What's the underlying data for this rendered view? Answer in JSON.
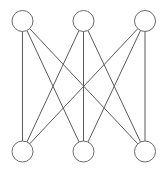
{
  "diagram": {
    "type": "bipartite-graph",
    "colors": {
      "background": "#ffffff",
      "edge": "#5a5a5a",
      "node_stroke": "#6a6a6a",
      "node_fill": "#ffffff"
    },
    "node_radius": 10.5,
    "nodes": [
      {
        "id": "t1",
        "row": "top",
        "x": 22.5,
        "y": 21
      },
      {
        "id": "t2",
        "row": "top",
        "x": 83.5,
        "y": 21
      },
      {
        "id": "t3",
        "row": "top",
        "x": 145,
        "y": 21
      },
      {
        "id": "b1",
        "row": "bottom",
        "x": 22.5,
        "y": 151.5
      },
      {
        "id": "b2",
        "row": "bottom",
        "x": 83.5,
        "y": 151.5
      },
      {
        "id": "b3",
        "row": "bottom",
        "x": 145,
        "y": 151.5
      }
    ],
    "edges": [
      [
        "t1",
        "b1"
      ],
      [
        "t1",
        "b2"
      ],
      [
        "t1",
        "b3"
      ],
      [
        "t2",
        "b1"
      ],
      [
        "t2",
        "b2"
      ],
      [
        "t2",
        "b3"
      ],
      [
        "t3",
        "b1"
      ],
      [
        "t3",
        "b2"
      ],
      [
        "t3",
        "b3"
      ]
    ]
  }
}
